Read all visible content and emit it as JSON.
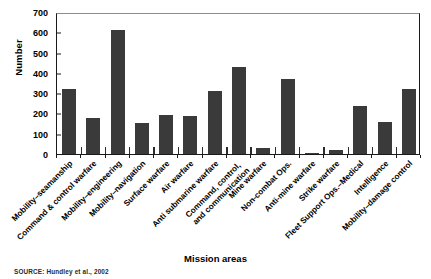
{
  "figure": {
    "source_note": "SOURCE: Hundley et al., 2002",
    "bar_color": "#3a3a3a",
    "frame_color": "#1a1a1a"
  },
  "chart_data": {
    "type": "bar",
    "title": "",
    "xlabel": "Mission areas",
    "ylabel": "Number",
    "ylim": [
      0,
      700
    ],
    "yticks": [
      0,
      100,
      200,
      300,
      400,
      500,
      600,
      700
    ],
    "grid": false,
    "legend": null,
    "categories": [
      "Mobility–seamanship",
      "Command & control warfare",
      "Mobility–engineering",
      "Mobility–navigation",
      "Surface warfare",
      "Air warfare",
      "Anti submarine warfare",
      "Command, control, and communication",
      "Mine warfare",
      "Non-combat Ops.",
      "Anti-mine warfare",
      "Strike warfare",
      "Fleet Support Ops.–Medical",
      "Intelligence",
      "Mobility–damage control"
    ],
    "values": [
      320,
      180,
      610,
      155,
      190,
      188,
      310,
      430,
      30,
      370,
      5,
      20,
      235,
      160,
      320
    ]
  }
}
